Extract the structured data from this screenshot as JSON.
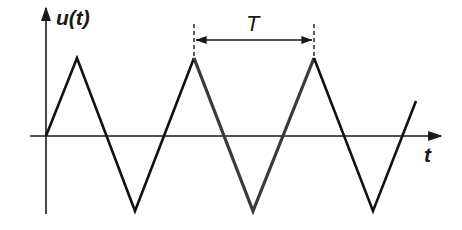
{
  "diagram": {
    "type": "triangle-wave",
    "y_axis_label": "u(t)",
    "x_axis_label": "t",
    "period_label": "T",
    "colors": {
      "axis": "#1a1a1a",
      "wave": "#111111",
      "highlight_period": "#3a3a3a",
      "dimension": "#1a1a1a"
    },
    "wave_points": [
      [
        46,
        136
      ],
      [
        77,
        58
      ],
      [
        135,
        211
      ],
      [
        194,
        58
      ],
      [
        253,
        211
      ],
      [
        314,
        58
      ],
      [
        373,
        211
      ],
      [
        416,
        101
      ]
    ],
    "highlighted_period": {
      "x_start": 194,
      "x_end": 314
    }
  }
}
